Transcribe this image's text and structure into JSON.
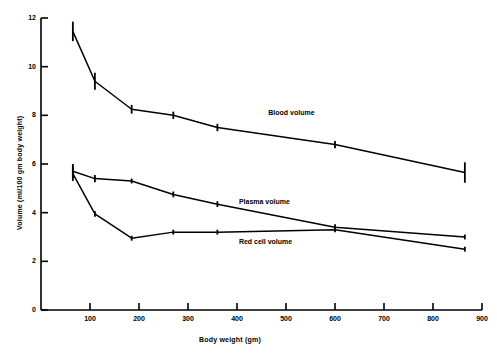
{
  "chart_data": {
    "type": "line",
    "title": "",
    "xlabel": "Body weight (gm)",
    "ylabel": "Volume (ml/100 gm body weight)",
    "xlim": [
      0,
      900
    ],
    "ylim": [
      0,
      12
    ],
    "xticks": [
      100,
      200,
      300,
      400,
      500,
      600,
      700,
      800,
      900
    ],
    "yticks": [
      0,
      2,
      4,
      6,
      8,
      10,
      12
    ],
    "grid": false,
    "legend_position": "inline-annotations",
    "series": [
      {
        "name": "Blood volume",
        "label_x": 570,
        "label_y": 8.1,
        "x": [
          65,
          110,
          185,
          270,
          360,
          600,
          865
        ],
        "y": [
          11.45,
          9.4,
          8.25,
          8.0,
          7.5,
          6.8,
          5.65
        ],
        "err": [
          0.4,
          0.35,
          0.18,
          0.15,
          0.15,
          0.15,
          0.42
        ]
      },
      {
        "name": "Plasma volume",
        "label_x": 510,
        "label_y": 4.45,
        "x": [
          65,
          110,
          185,
          270,
          360,
          600,
          865
        ],
        "y": [
          5.7,
          5.4,
          5.3,
          4.75,
          4.35,
          3.4,
          3.0
        ],
        "err": [
          0.3,
          0.15,
          0.1,
          0.12,
          0.12,
          0.12,
          0.1
        ]
      },
      {
        "name": "Red cell volume",
        "label_x": 510,
        "label_y": 2.8,
        "x": [
          65,
          110,
          185,
          270,
          360,
          600,
          865
        ],
        "y": [
          5.6,
          3.95,
          2.95,
          3.2,
          3.2,
          3.3,
          2.5
        ],
        "err": [
          0.3,
          0.12,
          0.1,
          0.1,
          0.1,
          0.1,
          0.1
        ]
      }
    ]
  },
  "xtick_labels": [
    "100",
    "200",
    "300",
    "400",
    "500",
    "600",
    "700",
    "800",
    "900"
  ],
  "ytick_labels": [
    "0",
    "2",
    "4",
    "6",
    "8",
    "10",
    "12"
  ],
  "axis": {
    "x_title": "Body weight (gm)",
    "y_title": "Volume (ml/100 gm body weight)"
  },
  "series_labels": {
    "blood": "Blood volume",
    "plasma": "Plasma volume",
    "redcell": "Red cell volume"
  },
  "colors": {
    "line": "#000000",
    "background": "#ffffff",
    "text": "#000000"
  }
}
